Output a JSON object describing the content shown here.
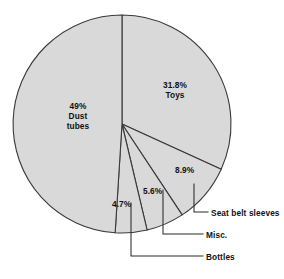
{
  "chart_data": {
    "type": "pie",
    "title": "",
    "xlabel": "",
    "ylabel": "",
    "legend_position": "none",
    "grid": false,
    "total_percent": 100.0,
    "start_angle_deg": 0,
    "direction": "clockwise",
    "categories": [
      "Toys",
      "Seat belt sleeves",
      "Misc.",
      "Bottles",
      "Dust tubes"
    ],
    "values": [
      31.8,
      8.9,
      5.6,
      4.7,
      49.0
    ],
    "slices": [
      {
        "label": "Toys",
        "value": 31.8,
        "value_text": "31.8%",
        "label_placement": "inside",
        "fill": "#d9d9d9",
        "stroke": "#3a3a3a"
      },
      {
        "label": "Seat belt sleeves",
        "value": 8.9,
        "value_text": "8.9%",
        "label_placement": "callout",
        "fill": "#d9d9d9",
        "stroke": "#3a3a3a"
      },
      {
        "label": "Misc.",
        "value": 5.6,
        "value_text": "5.6%",
        "label_placement": "callout",
        "fill": "#d9d9d9",
        "stroke": "#3a3a3a"
      },
      {
        "label": "Bottles",
        "value": 4.7,
        "value_text": "4.7%",
        "label_placement": "callout",
        "fill": "#d9d9d9",
        "stroke": "#3a3a3a"
      },
      {
        "label": "Dust tubes",
        "value": 49.0,
        "value_text": "49%",
        "label_placement": "inside",
        "fill": "#d9d9d9",
        "stroke": "#3a3a3a"
      }
    ]
  },
  "labels": {
    "toys_percent": "31.8%",
    "toys_name": "Toys",
    "dust_percent": "49%",
    "dust_name_line1": "Dust",
    "dust_name_line2": "tubes",
    "seatbelt_percent": "8.9%",
    "misc_percent": "5.6%",
    "bottles_percent": "4.7%",
    "seatbelt_name": "Seat belt sleeves",
    "misc_name": "Misc.",
    "bottles_name": "Bottles"
  },
  "colors": {
    "slice_fill": "#d9d9d9",
    "slice_stroke": "#3a3a3a",
    "leader_line": "#2b2b2b",
    "text": "#111111",
    "background": "#ffffff"
  }
}
